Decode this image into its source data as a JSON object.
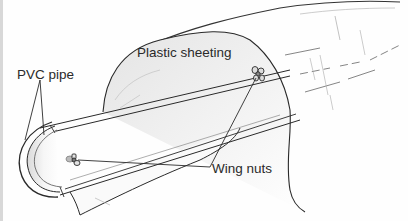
{
  "figure": {
    "labels": {
      "plastic_sheeting": "Plastic sheeting",
      "pvc_pipe": "PVC pipe",
      "wing_nuts": "Wing nuts"
    },
    "colors": {
      "line": "#2a2a2a",
      "shade": "#9a9a9a",
      "background": "#fefefe"
    }
  }
}
